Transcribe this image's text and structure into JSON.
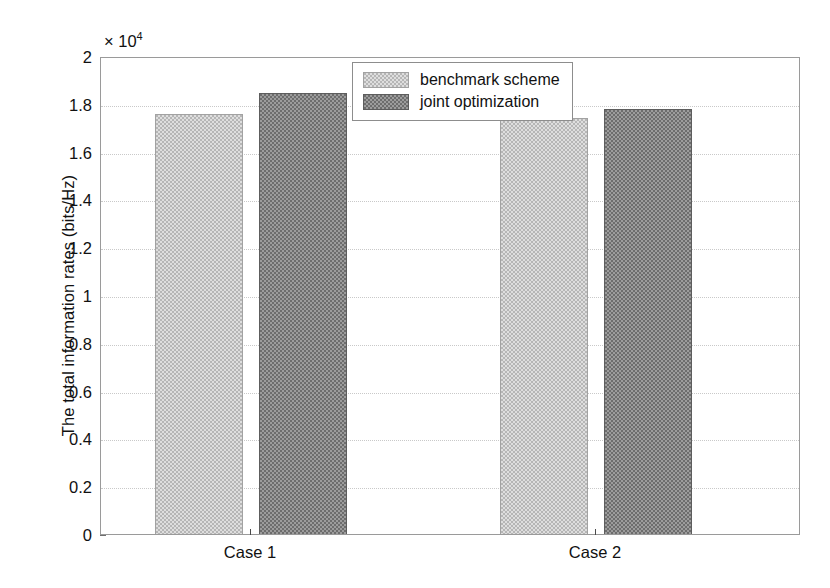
{
  "chart_data": {
    "type": "bar",
    "title": "",
    "xlabel": "",
    "ylabel": "The total information rates (bits/Hz)",
    "categories": [
      "Case 1",
      "Case 2"
    ],
    "series": [
      {
        "name": "benchmark scheme",
        "values": [
          17650,
          17490
        ],
        "color": "#b6b6b6"
      },
      {
        "name": "joint optimization",
        "values": [
          18540,
          17870
        ]
      }
    ],
    "ylim": [
      0,
      20000
    ],
    "ytick_values": [
      0,
      2000,
      4000,
      6000,
      8000,
      10000,
      12000,
      14000,
      16000,
      18000,
      20000
    ],
    "ytick_labels": [
      "0",
      "0.2",
      "0.4",
      "0.6",
      "0.8",
      "1",
      "1.2",
      "1.4",
      "1.6",
      "1.8",
      "2"
    ],
    "y_multiplier_mantissa": "× 10",
    "y_multiplier_exponent": "4",
    "grid": true,
    "grid_style": "dotted",
    "legend_position": "top-center-right",
    "colors": {
      "benchmark_scheme": "#b6b6b6",
      "joint_optimization": "#6d6d6d",
      "axis": "#9a9a9a",
      "grid": "#c9c9c9",
      "text": "#111111",
      "background": "#ffffff"
    }
  },
  "legend": {
    "items": [
      {
        "label": "benchmark scheme"
      },
      {
        "label": "joint optimization"
      }
    ]
  }
}
